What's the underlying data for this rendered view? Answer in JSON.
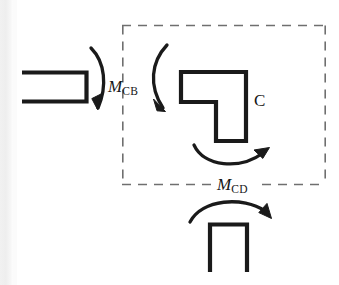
{
  "figure": {
    "kind": "free-body-diagram",
    "stroke_color": "#1a1a1a",
    "dash_color": "#6f6f6f",
    "background": "#ffffff"
  },
  "top_crop_remnant": {
    "text": "—  -  ———"
  },
  "labels": {
    "moment_cb": {
      "symbol": "M",
      "subscript": "CB"
    },
    "moment_cd": {
      "symbol": "M",
      "subscript": "CD"
    },
    "joint": {
      "text": "C"
    }
  },
  "members": [
    {
      "name": "beam-member-left",
      "shape": "open-left-bracket",
      "note": "horizontal member cut at left, drawn as ⊐"
    },
    {
      "name": "joint-member-L",
      "shape": "L-shape",
      "note": "L-shaped joint body at C inside the dashed free body"
    },
    {
      "name": "column-member-below",
      "shape": "open-bottom-bracket",
      "note": "vertical column below the joint, drawn as ⊓"
    }
  ],
  "arrows": [
    {
      "name": "moment-arrow-beam-end",
      "direction": "clockwise",
      "arrowhead": "down-left",
      "curve": "bows-right",
      "associated_label": "moment_cb"
    },
    {
      "name": "moment-arrow-joint-top",
      "direction": "clockwise",
      "arrowhead": "down-right",
      "curve": "bows-left",
      "associated_label": "moment_cb"
    },
    {
      "name": "moment-arrow-joint-bottom",
      "direction": "counterclockwise",
      "arrowhead": "up-right",
      "curve": "concave-up",
      "associated_label": "moment_cd"
    },
    {
      "name": "moment-arrow-column-top",
      "direction": "clockwise",
      "arrowhead": "down-right",
      "curve": "concave-down",
      "associated_label": "moment_cd"
    }
  ],
  "free_body_boundary": {
    "name": "dashed-cut-boundary",
    "style": "dashed",
    "x": 122,
    "y": 25,
    "width": 204,
    "height": 160
  }
}
